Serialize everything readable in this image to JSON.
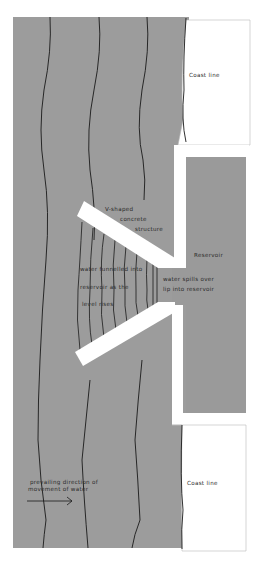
{
  "diagram": {
    "colors": {
      "water": "#9c9c9c",
      "reservoir": "#9a9a9a",
      "concrete": "#ffffff",
      "land": "#ffffff",
      "lines": "#1a1a1a",
      "border": "#b8b8b8"
    },
    "labels": {
      "coast_top": "Coast line",
      "coast_bottom": "Coast line",
      "v_structure_line1": "V-shaped",
      "v_structure_line2": "concrete",
      "v_structure_line3": "structure",
      "reservoir": "Reservoir",
      "funnel_line1": "water funnelled into",
      "funnel_line2": "reservoir as the",
      "funnel_line3": "level rises",
      "spill_line1": "water spills over",
      "spill_line2": "lip into reservoir",
      "direction_line1": "prevailing direction of",
      "direction_line2": "movement of water"
    },
    "icons": {
      "arrow": "arrow-right-icon"
    }
  }
}
